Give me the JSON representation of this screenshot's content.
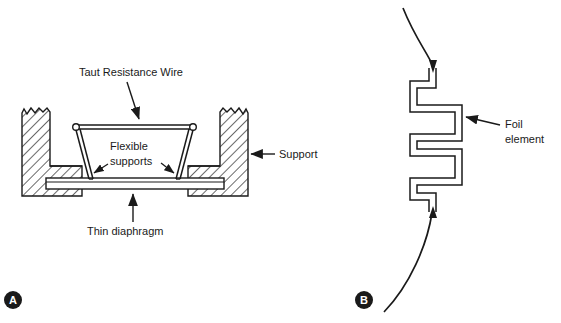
{
  "figure": {
    "background_color": "#ffffff",
    "line_color": "#1a1a1a",
    "panels": [
      {
        "id": "panel-a",
        "letter": "A",
        "title": "Unbonded taut resistance wire strain gauge cross-section",
        "labels": [
          {
            "key": "taut_wire",
            "text": "Taut Resistance Wire"
          },
          {
            "key": "flexible_line1",
            "text": "Flexible"
          },
          {
            "key": "flexible_line2",
            "text": "supports"
          },
          {
            "key": "support",
            "text": "Support"
          },
          {
            "key": "diaphragm",
            "text": "Thin diaphragm"
          }
        ]
      },
      {
        "id": "panel-b",
        "letter": "B",
        "title": "Bonded foil strain gauge serpentine element",
        "labels": [
          {
            "key": "foil_line1",
            "text": "Foil"
          },
          {
            "key": "foil_line2",
            "text": "element"
          }
        ]
      }
    ]
  },
  "panel_a": {
    "taut_wire_label": "Taut Resistance Wire",
    "flexible_label_line1": "Flexible",
    "flexible_label_line2": "supports",
    "support_label": "Support",
    "diaphragm_label": "Thin diaphragm",
    "letter": "A"
  },
  "panel_b": {
    "foil_label_line1": "Foil",
    "foil_label_line2": "element",
    "letter": "B"
  }
}
